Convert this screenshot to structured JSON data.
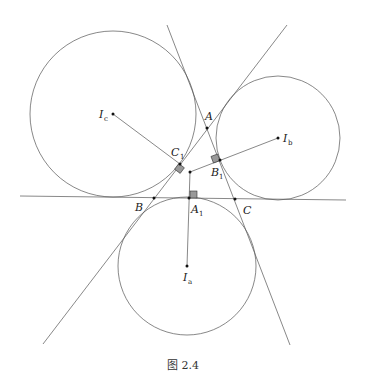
{
  "figure": {
    "caption": "图 2.4",
    "labels": {
      "A": "A",
      "B": "B",
      "C": "C",
      "A1": "A",
      "A1_sub": "1",
      "B1": "B",
      "B1_sub": "1",
      "C1": "C",
      "C1_sub": "1",
      "Ia": "I",
      "Ia_sub": "a",
      "Ib": "I",
      "Ib_sub": "b",
      "Ic": "I",
      "Ic_sub": "c"
    },
    "points": {
      "A": [
        207,
        128
      ],
      "B": [
        154,
        198
      ],
      "C": [
        235,
        199
      ],
      "A1": [
        189,
        198
      ],
      "B1": [
        220,
        160
      ],
      "C1": [
        180,
        164
      ],
      "P": [
        190,
        172
      ],
      "Ia": [
        187,
        266
      ],
      "Ib": [
        278,
        138
      ],
      "Ic": [
        113,
        114
      ]
    },
    "circles": [
      {
        "name": "excircle-c",
        "center": [
          113,
          114
        ],
        "r": 83
      },
      {
        "name": "excircle-b",
        "center": [
          278,
          138
        ],
        "r": 62
      },
      {
        "name": "excircle-a",
        "center": [
          187,
          266
        ],
        "r": 69
      }
    ],
    "colors": {
      "line": "#555555",
      "marker": "#999999",
      "point": "#111111"
    }
  }
}
